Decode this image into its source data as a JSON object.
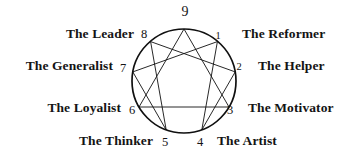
{
  "diagram": {
    "name": "Enneagram of Personality Types",
    "circle": {
      "cx": 184,
      "cy": 81,
      "r": 52,
      "stroke": "#101010",
      "stroke_width": 1.6
    },
    "inner_figure": {
      "triangle": [
        9,
        3,
        6
      ],
      "hexad": [
        1,
        4,
        2,
        8,
        5,
        7
      ],
      "stroke": "#101010",
      "stroke_width": 0.9
    },
    "points": [
      {
        "number": "1",
        "type_name": "The Reformer",
        "angle_deg": -50,
        "num_x": 218,
        "num_y": 36,
        "label_x": 240,
        "label_y": 28,
        "label_side": "right",
        "num_size": "small"
      },
      {
        "number": "2",
        "type_name": "The Helper",
        "angle_deg": -10,
        "num_x": 238,
        "num_y": 67,
        "label_x": 255,
        "label_y": 62,
        "label_side": "right",
        "num_size": "small"
      },
      {
        "number": "3",
        "type_name": "The Motivator",
        "angle_deg": 30,
        "num_x": 228,
        "num_y": 109,
        "label_x": 246,
        "label_y": 103,
        "label_side": "right",
        "num_size": "normal"
      },
      {
        "number": "4",
        "type_name": "The Artist",
        "angle_deg": 70,
        "num_x": 197,
        "num_y": 143,
        "label_x": 215,
        "label_y": 138,
        "label_side": "right",
        "num_size": "normal"
      },
      {
        "number": "5",
        "type_name": "The Thinker",
        "angle_deg": 110,
        "num_x": 163,
        "num_y": 143,
        "label_x": 155,
        "label_y": 138,
        "label_side": "left",
        "num_size": "normal"
      },
      {
        "number": "6",
        "type_name": "The Loyalist",
        "angle_deg": 150,
        "num_x": 130,
        "num_y": 109,
        "label_x": 118,
        "label_y": 103,
        "label_side": "left",
        "num_size": "normal"
      },
      {
        "number": "7",
        "type_name": "The Generalist",
        "angle_deg": 190,
        "num_x": 121,
        "num_y": 67,
        "label_x": 113,
        "label_y": 62,
        "label_side": "left",
        "num_size": "normal"
      },
      {
        "number": "8",
        "type_name": "The Leader",
        "angle_deg": 230,
        "num_x": 142,
        "num_y": 33,
        "label_x": 132,
        "label_y": 28,
        "label_side": "left",
        "num_size": "normal"
      },
      {
        "number": "9",
        "type_name": "",
        "angle_deg": 270,
        "num_x": 184,
        "num_y": 12,
        "label_x": 184,
        "label_y": 12,
        "label_side": "center",
        "num_size": "big"
      }
    ],
    "labels": {
      "reformer": "The Reformer",
      "helper": "The Helper",
      "motivator": "The Motivator",
      "artist": "The Artist",
      "thinker": "The Thinker",
      "loyalist": "The Loyalist",
      "generalist": "The Generalist",
      "leader": "The Leader"
    },
    "numbers": {
      "one": "1",
      "two": "2",
      "three": "3",
      "four": "4",
      "five": "5",
      "six": "6",
      "seven": "7",
      "eight": "8",
      "nine": "9"
    }
  },
  "colors": {
    "ink": "#101010",
    "background": "#ffffff"
  }
}
